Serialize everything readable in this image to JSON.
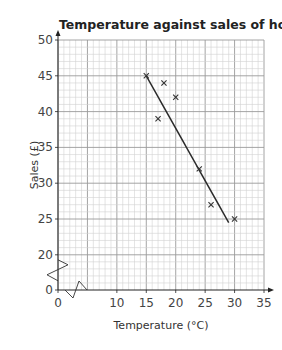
{
  "chart_data": {
    "type": "scatter",
    "title": "Temperature against sales of hot drinks",
    "xlabel": "Temperature (°C)",
    "ylabel": "Sales (£)",
    "x_ticks": [
      0,
      10,
      15,
      20,
      25,
      30,
      35
    ],
    "y_ticks": [
      0,
      20,
      25,
      30,
      35,
      40,
      45,
      50
    ],
    "xlim": [
      0,
      35
    ],
    "ylim": [
      0,
      50
    ],
    "axis_breaks": {
      "x": "0 to 10 (zigzag)",
      "y": "0 to 20 (zigzag)"
    },
    "grid": true,
    "series": [
      {
        "name": "data points",
        "marker": "x",
        "points": [
          {
            "x": 15,
            "y": 45
          },
          {
            "x": 18,
            "y": 44
          },
          {
            "x": 17,
            "y": 39
          },
          {
            "x": 20,
            "y": 42
          },
          {
            "x": 24,
            "y": 32
          },
          {
            "x": 26,
            "y": 27
          },
          {
            "x": 30,
            "y": 25
          }
        ]
      },
      {
        "name": "line of best fit",
        "type": "line",
        "points": [
          {
            "x": 15,
            "y": 45
          },
          {
            "x": 29,
            "y": 24.5
          }
        ]
      }
    ]
  },
  "labels": {
    "title": "Temperature against sales of hot drinks",
    "xlabel": "Temperature (°C)",
    "ylabel": "Sales (£)",
    "x_ticks": [
      "0",
      "10",
      "15",
      "20",
      "25",
      "30",
      "35"
    ],
    "y_ticks": [
      "0",
      "20",
      "25",
      "30",
      "35",
      "40",
      "45",
      "50"
    ]
  }
}
